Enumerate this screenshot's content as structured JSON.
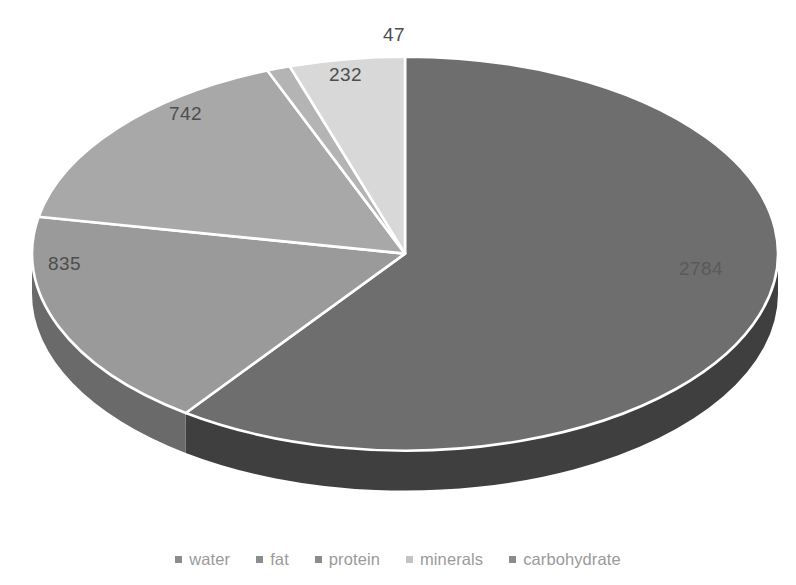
{
  "chart_data": {
    "type": "pie",
    "title": "",
    "subtitle": "",
    "xlabel": "",
    "ylabel": "",
    "three_d": true,
    "grid": false,
    "legend_position": "bottom",
    "total": 4640,
    "categories": [
      "water",
      "fat",
      "protein",
      "minerals",
      "carbohydrate"
    ],
    "values": [
      2784,
      835,
      742,
      47,
      232
    ],
    "labels": [
      "2784",
      "835",
      "742",
      "47",
      "232"
    ],
    "slices": [
      {
        "name": "water",
        "value": 2784,
        "label": "2784",
        "color": "#6e6e6e",
        "side_color": "#3f3f3f"
      },
      {
        "name": "fat",
        "value": 835,
        "label": "835",
        "color": "#9a9a9a",
        "side_color": "#6a6a6a"
      },
      {
        "name": "protein",
        "value": 742,
        "label": "742",
        "color": "#a8a8a8",
        "side_color": "#767676"
      },
      {
        "name": "minerals",
        "value": 47,
        "label": "47",
        "color": "#b4b4b4",
        "side_color": "#808080"
      },
      {
        "name": "carbohydrate",
        "value": 232,
        "label": "232",
        "color": "#d8d8d8",
        "side_color": "#9c9c9c"
      }
    ]
  },
  "legend": {
    "items": [
      {
        "label": "water",
        "color": "#8c8c8c"
      },
      {
        "label": "fat",
        "color": "#8c8c8c"
      },
      {
        "label": "protein",
        "color": "#8c8c8c"
      },
      {
        "label": "minerals",
        "color": "#c4c4c4"
      },
      {
        "label": "carbohydrate",
        "color": "#8c8c8c"
      }
    ]
  },
  "labels_positions": {
    "water": "2784",
    "fat": "835",
    "protein": "742",
    "minerals": "47",
    "carbohydrate": "232"
  },
  "style": {
    "background": "#ffffff",
    "separator": "#ffffff",
    "label_color": "#4d4d4d",
    "legend_text_color": "#9a9a9a"
  }
}
